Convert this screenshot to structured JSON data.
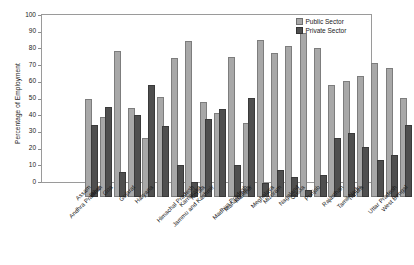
{
  "chart_data": {
    "type": "bar",
    "title": "",
    "xlabel": "",
    "ylabel": "Percentage of Employment",
    "ylim": [
      0,
      100
    ],
    "yticks": [
      0,
      10,
      20,
      30,
      40,
      50,
      60,
      70,
      80,
      90,
      100
    ],
    "grid": false,
    "legend_position": "top-right",
    "categories": [
      "Andhra Pradesh",
      "Assam",
      "Bihar",
      "Goa",
      "Gujarat",
      "Haryana",
      "Himachal Pradesh",
      "Jammu and Kashmir",
      "Karnataka",
      "Kerala",
      "Madhya Pradesh",
      "Maharashtra",
      "Manipur",
      "Meghalaya",
      "Mizoram",
      "Nagaland",
      "Orissa",
      "Punjab",
      "Rajasthan",
      "Tamil Nadu",
      "Tripura",
      "Uttar Pradesh",
      "West Bengal"
    ],
    "series": [
      {
        "name": "Public Sector",
        "color": "#a8a8a8",
        "values": [
          57.5,
          46.5,
          86,
          52,
          34,
          58.5,
          82,
          92,
          55.5,
          49,
          82.5,
          43,
          93,
          85,
          89.5,
          97,
          88,
          66,
          68,
          71.5,
          79,
          76,
          58
        ]
      },
      {
        "name": "Private Sector",
        "color": "#4f4f4f",
        "values": [
          42,
          53,
          14,
          48,
          66,
          41.5,
          18,
          8,
          45.5,
          51.5,
          18,
          58,
          7,
          15,
          10.5,
          3,
          12,
          34,
          37,
          28.5,
          21,
          24,
          42
        ]
      }
    ]
  },
  "legend": {
    "items": [
      {
        "label": "Public Sector"
      },
      {
        "label": "Private Sector"
      }
    ]
  }
}
